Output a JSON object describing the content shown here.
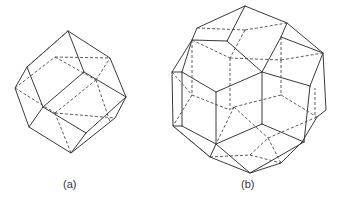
{
  "figure": {
    "panels": [
      {
        "id": "a",
        "label": "(a)",
        "description": "rhombic dodecahedron (wireframe, hidden edges dashed)"
      },
      {
        "id": "b",
        "label": "(b)",
        "description": "rhombic triacontahedron (wireframe, hidden edges dashed)"
      }
    ],
    "colors": {
      "edge": "#3a3a3a",
      "background": "#ffffff"
    }
  }
}
